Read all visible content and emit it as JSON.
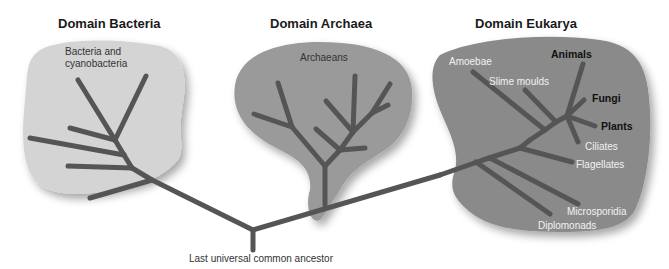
{
  "domains": [
    {
      "title": "Domain Bacteria",
      "group_label": "Bacteria and cyanobacteria",
      "blob_color": "#d4d4d4"
    },
    {
      "title": "Domain Archaea",
      "group_label": "Archaeans",
      "blob_color": "#9a9a9a"
    },
    {
      "title": "Domain Eukarya",
      "blob_color": "#8a8a8a"
    }
  ],
  "eukarya_groups": [
    {
      "label": "Amoebae",
      "style": "light"
    },
    {
      "label": "Slime moulds",
      "style": "light"
    },
    {
      "label": "Animals",
      "style": "bold"
    },
    {
      "label": "Fungi",
      "style": "bold"
    },
    {
      "label": "Plants",
      "style": "bold"
    },
    {
      "label": "Ciliates",
      "style": "light"
    },
    {
      "label": "Flagellates",
      "style": "light"
    },
    {
      "label": "Microsporidia",
      "style": "light"
    },
    {
      "label": "Diplomonads",
      "style": "light"
    }
  ],
  "root": {
    "label": "Last universal common ancestor"
  },
  "colors": {
    "branch": "#555555",
    "title": "#1a1a1a",
    "text_dark": "#333333",
    "text_light": "#f2f2f2"
  }
}
